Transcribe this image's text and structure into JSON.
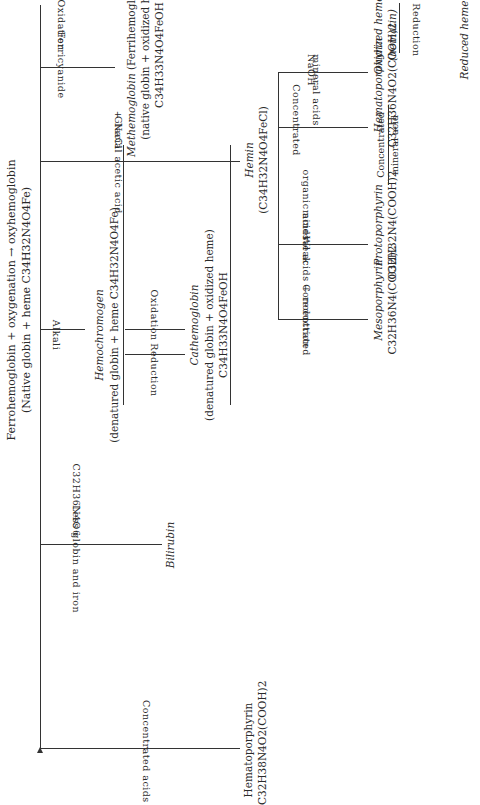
{
  "title": {
    "line1": "Ferrohemoglobin + oxygenation → oxyhemoglobin",
    "line2": "(Native globin + heme C34H32N4O4Fe)"
  },
  "branches": [
    {
      "reagent_above": "Concentrated acids",
      "reagent_below": "",
      "product_name": "Hematoporphyrin",
      "product_formula": "C32H38N4O2(COOH)2"
    },
    {
      "reagent_above": "Less globin and iron",
      "reagent_below": "C32H36N4O6",
      "product_name": "Bilirubin"
    },
    {
      "reagent_above": "Alkali",
      "product_name": "Hemochromogen",
      "product_detail": "(denatured globin + heme C34H32N4O4Fe)"
    },
    {
      "reagent_above": "Glacial acetic acid",
      "reagent_below": "+ NaCl",
      "product_name": "Hemin",
      "product_formula": "(C34H32N4O4FeCl)"
    },
    {
      "reagent_above": "Ferricyanide",
      "reagent_below": "Oxidation",
      "product_name": "Methemoglobin",
      "product_alt": "(Ferrihemoglobin)",
      "product_detail": "(native globin + oxidized heme)",
      "product_formula": "C34H33N4O4FeOH"
    }
  ],
  "hemochromogen_cycle": {
    "oxidation_label": "Oxidation",
    "reduction_label": "Reduction",
    "product_name": "Cathemoglobin",
    "product_detail": "(denatured globin + oxidized heme)",
    "product_formula": "C34H33N4O4FeOH"
  },
  "hemin_branches": [
    {
      "reagent_above": "Concentrated",
      "reagent_below": "mineral acids + reduction",
      "product_name": "Mesoporphyrin",
      "product_formula": "C32H36N4(COOH)2"
    },
    {
      "reagent_above": "Weak",
      "reagent_below": "organic acids",
      "product_name": "Protoporphyrin",
      "product_formula": "C32H32N4(COOH)2"
    },
    {
      "reagent_above": "Concentrated",
      "reagent_below": "mineral acids",
      "product_name": "Hematoporphyrin",
      "product_formula": "C32H36N4O2(COOH)2"
    },
    {
      "reagent_above": "NaOH",
      "product_name": "Oxidized heme",
      "product_alt": "(hematin)"
    }
  ],
  "proto_to_hemato": {
    "above": "Concentrated",
    "below": "mineral acid"
  },
  "hematin_reduction": {
    "label": "Reduction",
    "product_name": "Reduced heme"
  }
}
